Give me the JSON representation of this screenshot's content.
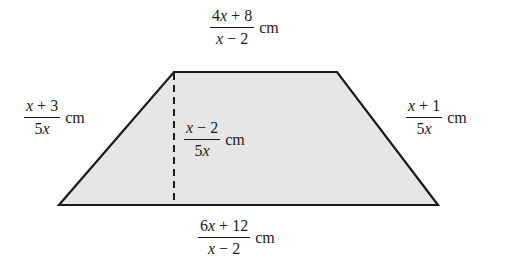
{
  "diagram": {
    "type": "trapezoid",
    "fill_color": "#e6e6e6",
    "stroke_color": "#1a1a1a",
    "vertices": {
      "top_left": [
        174,
        72
      ],
      "top_right": [
        337,
        72
      ],
      "bottom_right": [
        438,
        205
      ],
      "bottom_left": [
        59,
        205
      ]
    },
    "height_line": {
      "style": "dashed",
      "x": 174,
      "y1": 72,
      "y2": 205
    }
  },
  "labels": {
    "top_base": {
      "numerator": "4x + 8",
      "denominator": "x − 2",
      "unit": "cm"
    },
    "left_side": {
      "numerator": "x + 3",
      "denominator": "5x",
      "unit": "cm"
    },
    "height": {
      "numerator": "x − 2",
      "denominator": "5x",
      "unit": "cm"
    },
    "right_side": {
      "numerator": "x + 1",
      "denominator": "5x",
      "unit": "cm"
    },
    "bottom_base": {
      "numerator": "6x + 12",
      "denominator": "x − 2",
      "unit": "cm"
    }
  }
}
